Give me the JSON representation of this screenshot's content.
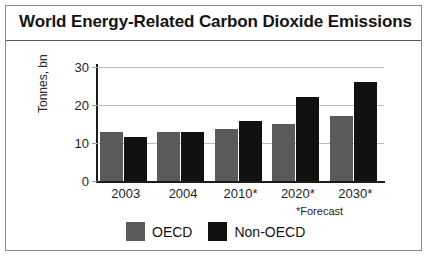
{
  "figure": {
    "title": "World Energy-Related Carbon Dioxide Emissions",
    "footnote": "*Forecast"
  },
  "colors": {
    "oecd": "#5a5a5a",
    "non_oecd": "#111111",
    "axis": "#1c1c1c",
    "grid": "#bdbdbd",
    "border": "#8a8a8a",
    "text": "#141414"
  },
  "chart_data": {
    "type": "bar",
    "title": "World Energy-Related Carbon Dioxide Emissions",
    "xlabel": "",
    "ylabel": "Tonnes, bn",
    "categories": [
      "2003",
      "2004",
      "2010*",
      "2020*",
      "2030*"
    ],
    "series": [
      {
        "name": "OECD",
        "color": "#5a5a5a",
        "values": [
          13,
          13,
          13.8,
          15,
          17
        ]
      },
      {
        "name": "Non-OECD",
        "color": "#111111",
        "values": [
          11.6,
          13,
          15.7,
          22,
          26
        ]
      }
    ],
    "ylim": [
      0,
      30
    ],
    "yticks": [
      0,
      10,
      20,
      30
    ],
    "ytick_labels": [
      "0",
      "10",
      "20",
      "30"
    ],
    "grid": true,
    "legend_position": "bottom",
    "annotations": [
      "*Forecast"
    ]
  }
}
